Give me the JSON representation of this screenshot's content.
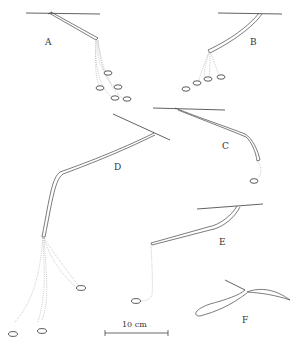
{
  "figure": {
    "panels": [
      {
        "id": "A",
        "label": "A"
      },
      {
        "id": "B",
        "label": "B"
      },
      {
        "id": "C",
        "label": "C"
      },
      {
        "id": "D",
        "label": "D"
      },
      {
        "id": "E",
        "label": "E"
      },
      {
        "id": "F",
        "label": "F"
      }
    ],
    "scale_bar": {
      "label": "10 cm"
    },
    "colors": {
      "line": "#3a3a3a",
      "dotted": "#9a9a9a",
      "background": "#ffffff"
    }
  }
}
